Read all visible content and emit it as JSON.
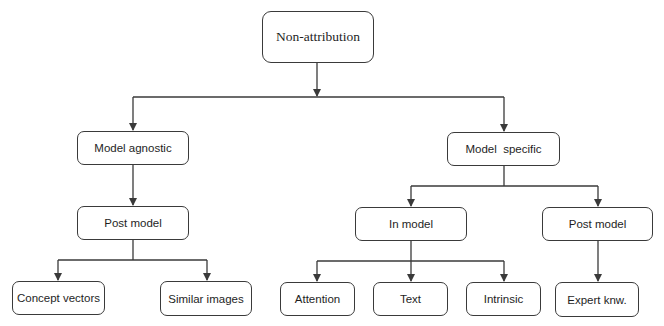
{
  "diagram": {
    "type": "tree",
    "colors": {
      "line": "#3a3a3a",
      "text": "#1e1e1e",
      "background": "#ffffff"
    },
    "nodes": {
      "root": {
        "label": "Non-attribution"
      },
      "model_agnostic": {
        "label": "Model agnostic"
      },
      "model_specific": {
        "label": "Model  specific"
      },
      "agnostic_post_model": {
        "label": "Post model"
      },
      "in_model": {
        "label": "In model"
      },
      "specific_post_model": {
        "label": "Post model"
      },
      "concept_vectors": {
        "label": "Concept vectors"
      },
      "similar_images": {
        "label": "Similar images"
      },
      "attention": {
        "label": "Attention"
      },
      "text": {
        "label": "Text"
      },
      "intrinsic": {
        "label": "Intrinsic"
      },
      "expert_knw": {
        "label": "Expert knw."
      }
    },
    "edges": [
      {
        "from": "root",
        "to": "model_agnostic"
      },
      {
        "from": "root",
        "to": "model_specific"
      },
      {
        "from": "model_agnostic",
        "to": "agnostic_post_model"
      },
      {
        "from": "agnostic_post_model",
        "to": "concept_vectors"
      },
      {
        "from": "agnostic_post_model",
        "to": "similar_images"
      },
      {
        "from": "model_specific",
        "to": "in_model"
      },
      {
        "from": "model_specific",
        "to": "specific_post_model"
      },
      {
        "from": "in_model",
        "to": "attention"
      },
      {
        "from": "in_model",
        "to": "text"
      },
      {
        "from": "in_model",
        "to": "intrinsic"
      },
      {
        "from": "specific_post_model",
        "to": "expert_knw"
      }
    ]
  }
}
